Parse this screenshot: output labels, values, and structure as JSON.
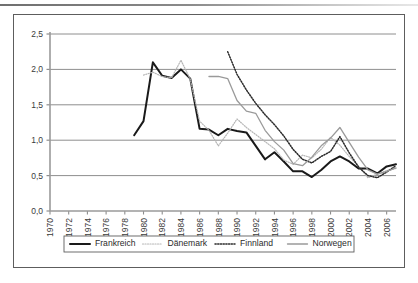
{
  "figure": {
    "border_color": "#5d5d5d",
    "background": "#ffffff"
  },
  "axis": {
    "y_ticks": [
      "0,0",
      "0,5",
      "1,0",
      "1,5",
      "2,0",
      "2,5"
    ],
    "x_ticks": [
      "1970",
      "1972",
      "1974",
      "1976",
      "1978",
      "1980",
      "1982",
      "1984",
      "1986",
      "1988",
      "1990",
      "1992",
      "1994",
      "1996",
      "1998",
      "2000",
      "2002",
      "2004",
      "2006"
    ]
  },
  "legend": {
    "items": [
      {
        "label": "Frankreich",
        "style": "solid-thick",
        "color": "#1a1a1a"
      },
      {
        "label": "Dänemark",
        "style": "dotted-light",
        "color": "#b5b5b5"
      },
      {
        "label": "Finnland",
        "style": "dotted-dark",
        "color": "#2b2b2b"
      },
      {
        "label": "Norwegen",
        "style": "solid-gray",
        "color": "#9a9a9a"
      }
    ]
  },
  "chart_data": {
    "type": "line",
    "title": "",
    "xlabel": "",
    "ylabel": "",
    "xlim": [
      1970,
      2007
    ],
    "ylim": [
      0.0,
      2.5
    ],
    "grid": true,
    "legend_position": "bottom",
    "decimal_separator": ",",
    "series": [
      {
        "name": "Frankreich",
        "color": "#1a1a1a",
        "style": "solid-thick",
        "x": [
          1979,
          1980,
          1981,
          1982,
          1983,
          1984,
          1985,
          1986,
          1987,
          1988,
          1989,
          1990,
          1991,
          1992,
          1993,
          1994,
          1995,
          1996,
          1997,
          1998,
          1999,
          2000,
          2001,
          2002,
          2003,
          2004,
          2005,
          2006,
          2007
        ],
        "values": [
          1.07,
          1.27,
          2.1,
          1.91,
          1.88,
          2.0,
          1.87,
          1.16,
          1.15,
          1.07,
          1.16,
          1.13,
          1.11,
          0.92,
          0.73,
          0.83,
          0.7,
          0.56,
          0.56,
          0.48,
          0.58,
          0.7,
          0.77,
          0.7,
          0.6,
          0.6,
          0.53,
          0.63,
          0.66
        ]
      },
      {
        "name": "Dänemark",
        "color": "#b5b5b5",
        "style": "dotted-light",
        "x": [
          1980,
          1981,
          1982,
          1983,
          1984,
          1985,
          1986,
          1987,
          1988,
          1989,
          1990,
          1991,
          1992,
          1993,
          1994,
          1995,
          1996,
          1997,
          1998,
          1999,
          2000,
          2001,
          2002,
          2003,
          2004,
          2005,
          2006,
          2007
        ],
        "values": [
          1.92,
          1.96,
          1.9,
          1.88,
          2.13,
          1.86,
          1.27,
          1.14,
          0.92,
          1.1,
          1.3,
          1.18,
          1.08,
          0.98,
          0.88,
          0.72,
          0.66,
          0.79,
          0.75,
          0.87,
          1.04,
          0.93,
          0.77,
          0.63,
          0.47,
          0.52,
          0.57,
          0.6
        ]
      },
      {
        "name": "Finnland",
        "color": "#2b2b2b",
        "style": "dotted-dark",
        "x": [
          1989,
          1990,
          1991,
          1992,
          1993,
          1994,
          1995,
          1996,
          1997,
          1998,
          1999,
          2000,
          2001,
          2002,
          2003,
          2004,
          2005,
          2006,
          2007
        ],
        "values": [
          2.25,
          1.93,
          1.71,
          1.52,
          1.36,
          1.22,
          1.06,
          0.87,
          0.73,
          0.68,
          0.77,
          0.84,
          1.05,
          0.82,
          0.62,
          0.5,
          0.47,
          0.55,
          0.64
        ]
      },
      {
        "name": "Norwegen",
        "color": "#9a9a9a",
        "style": "solid-gray",
        "x": [
          1987,
          1988,
          1989,
          1990,
          1991,
          1992,
          1993,
          1994,
          1995,
          1996,
          1997,
          1998,
          1999,
          2000,
          2001,
          2002,
          2003,
          2004,
          2005,
          2006,
          2007
        ],
        "values": [
          1.9,
          1.9,
          1.87,
          1.56,
          1.41,
          1.38,
          1.14,
          0.98,
          0.86,
          0.67,
          0.64,
          0.76,
          0.92,
          1.03,
          1.18,
          0.97,
          0.76,
          0.58,
          0.52,
          0.56,
          0.61
        ]
      }
    ]
  }
}
